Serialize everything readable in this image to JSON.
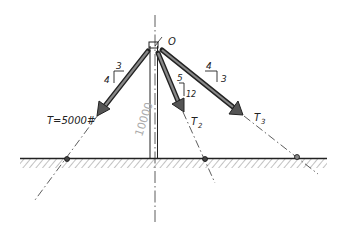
{
  "diagram": {
    "point_label": "O",
    "pole_load_label": "10000",
    "forces": [
      {
        "id": "T1",
        "label": "T=5000#",
        "slope_rise": "4",
        "slope_run": "3"
      },
      {
        "id": "T2",
        "label": "T2",
        "label_main": "T",
        "label_sub": "2",
        "slope_rise": "12",
        "slope_run": "5"
      },
      {
        "id": "T3",
        "label": "T3",
        "label_main": "T",
        "label_sub": "3",
        "slope_rise": "3",
        "slope_run": "4"
      }
    ],
    "colors": {
      "ink": "#222222",
      "arrow_fill": "#555555",
      "hatch": "#888888",
      "faint_label": "#aaaaaa"
    }
  }
}
